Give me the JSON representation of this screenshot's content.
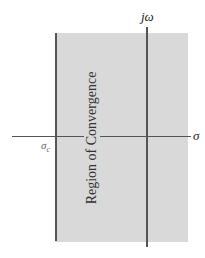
{
  "diagram": {
    "title": "",
    "region_label": "Region of Convergence",
    "axes": {
      "vertical_label": "jω",
      "horizontal_label": "σ"
    },
    "boundary_label": "σ",
    "boundary_subscript": "c",
    "colors": {
      "region_fill": "#d9d9d9",
      "lines": "#555555"
    }
  }
}
